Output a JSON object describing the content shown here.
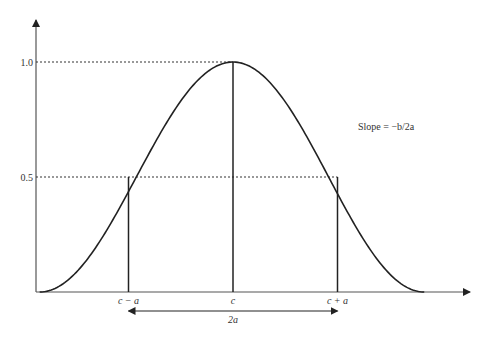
{
  "chart_data": {
    "type": "line",
    "title": "",
    "xlabel": "",
    "ylabel": "",
    "y_ticks": [
      "0.5",
      "1.0"
    ],
    "y_tick_values": [
      0.5,
      1.0
    ],
    "x_ticks": [
      "c − a",
      "c",
      "c + a"
    ],
    "x_tick_values": [
      -1,
      0,
      1
    ],
    "x_range": [
      -1.85,
      1.83
    ],
    "ylim": [
      0,
      1
    ],
    "peak": {
      "x": 0,
      "y": 1.0
    },
    "half_points": [
      {
        "x": -1,
        "y": 0.5
      },
      {
        "x": 1,
        "y": 0.5
      }
    ],
    "annotations": {
      "slope": "Slope = −b/2a",
      "width": "2a"
    }
  }
}
